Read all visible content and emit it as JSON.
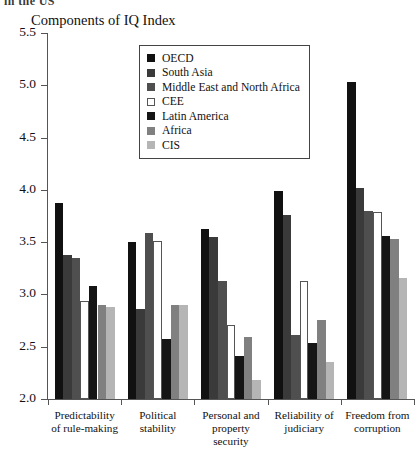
{
  "page": {
    "clipped_header_text": "in the US"
  },
  "chart_data": {
    "type": "bar",
    "title": "Components of IQ Index",
    "xlabel": "",
    "ylabel": "",
    "ylim": [
      2.0,
      5.5
    ],
    "ytick_labels": [
      "5.5",
      "5.0",
      "4.5",
      "4.0",
      "3.5",
      "3.0",
      "2.5",
      "2.0"
    ],
    "ytick_values": [
      5.5,
      5.0,
      4.5,
      4.0,
      3.5,
      3.0,
      2.5,
      2.0
    ],
    "grid": false,
    "legend_position": "top-center",
    "categories": [
      "Predictability of rule-making",
      "Political stability",
      "Personal and property security",
      "Reliability of judiciary",
      "Freedom from corruption"
    ],
    "category_lines": [
      [
        "Predictability",
        "of rule-making"
      ],
      [
        "Political",
        "stability"
      ],
      [
        "Personal and",
        "property security"
      ],
      [
        "Reliability of",
        "judiciary"
      ],
      [
        "Freedom from",
        "corruption"
      ]
    ],
    "series": [
      {
        "name": "OECD",
        "color": "#111111",
        "border": "#111111",
        "values": [
          3.87,
          3.5,
          3.63,
          3.99,
          5.03
        ]
      },
      {
        "name": "South Asia",
        "color": "#3a3a3a",
        "border": "#3a3a3a",
        "values": [
          3.38,
          2.86,
          3.55,
          3.76,
          4.02
        ]
      },
      {
        "name": "Middle East and North Africa",
        "color": "#4f4f4f",
        "border": "#4f4f4f",
        "values": [
          3.35,
          3.59,
          3.13,
          2.61,
          3.8
        ]
      },
      {
        "name": "CEE",
        "color": "#ffffff",
        "border": "#555555",
        "values": [
          2.94,
          3.51,
          2.71,
          3.13,
          3.79
        ]
      },
      {
        "name": "Latin America",
        "color": "#151515",
        "border": "#151515",
        "values": [
          3.08,
          2.57,
          2.41,
          2.54,
          3.56
        ]
      },
      {
        "name": "Africa",
        "color": "#808080",
        "border": "#808080",
        "values": [
          2.9,
          2.9,
          2.59,
          2.76,
          3.53
        ]
      },
      {
        "name": "CIS",
        "color": "#b5b5b5",
        "border": "#b5b5b5",
        "values": [
          2.88,
          2.9,
          2.18,
          2.35,
          3.16
        ]
      }
    ]
  }
}
